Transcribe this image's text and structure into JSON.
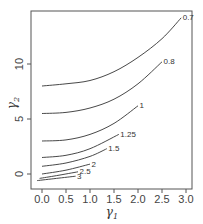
{
  "chart_data": {
    "type": "line",
    "title": "",
    "xlabel": "γ1",
    "ylabel": "γ2",
    "xlim": [
      -0.2,
      3.1
    ],
    "ylim": [
      -1.2,
      14.5
    ],
    "x_ticks": [
      "0.0",
      "0.5",
      "1.0",
      "1.5",
      "2.0",
      "2.5",
      "3.0"
    ],
    "y_ticks": [
      "0",
      "5",
      "10"
    ],
    "grid": false,
    "legend": "inline contour labels",
    "series": [
      {
        "name": "0.7",
        "x": [
          0.0,
          0.5,
          1.0,
          1.5,
          2.0,
          2.5,
          2.9
        ],
        "y": [
          8.0,
          8.2,
          8.5,
          9.3,
          10.6,
          12.3,
          14.2
        ]
      },
      {
        "name": "0.8",
        "x": [
          0.0,
          0.5,
          1.0,
          1.5,
          2.0,
          2.5
        ],
        "y": [
          5.5,
          5.6,
          6.0,
          6.8,
          8.2,
          10.2
        ]
      },
      {
        "name": "1",
        "x": [
          0.0,
          0.5,
          1.0,
          1.5,
          2.0
        ],
        "y": [
          3.0,
          3.1,
          3.6,
          4.6,
          6.2
        ]
      },
      {
        "name": "1.25",
        "x": [
          0.0,
          0.5,
          1.0,
          1.6
        ],
        "y": [
          1.5,
          1.7,
          2.3,
          3.6
        ]
      },
      {
        "name": "1.5",
        "x": [
          0.0,
          0.5,
          1.0,
          1.35
        ],
        "y": [
          0.7,
          1.0,
          1.6,
          2.3
        ]
      },
      {
        "name": "2",
        "x": [
          0.0,
          0.5,
          1.0
        ],
        "y": [
          0.0,
          0.35,
          0.9
        ]
      },
      {
        "name": "2.5",
        "x": [
          -0.05,
          0.3,
          0.75
        ],
        "y": [
          -0.4,
          -0.15,
          0.2
        ]
      },
      {
        "name": "3",
        "x": [
          -0.1,
          0.3,
          0.7
        ],
        "y": [
          -0.6,
          -0.4,
          -0.2
        ]
      }
    ]
  },
  "labels": {
    "xlabel": "γ",
    "xlabel_sub": "1",
    "ylabel": "γ",
    "ylabel_sub": "2"
  }
}
